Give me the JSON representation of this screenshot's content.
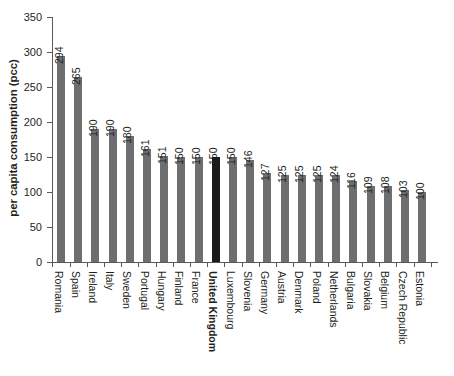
{
  "chart_data": {
    "type": "bar",
    "title": "",
    "subtitle": "",
    "xlabel": "",
    "ylabel": "per capita consumption (pcc)",
    "ylim": [
      0,
      350
    ],
    "yticks": [
      0,
      50,
      100,
      150,
      200,
      250,
      300,
      350
    ],
    "grid": false,
    "legend": null,
    "categories": [
      "Romania",
      "Spain",
      "Ireland",
      "Italy",
      "Sweden",
      "Portugal",
      "Hungary",
      "Finland",
      "France",
      "United Kingdom",
      "Luxembourg",
      "Slovenia",
      "Germany",
      "Austria",
      "Denmark",
      "Poland",
      "Netherlands",
      "Bulgaria",
      "Slovakia",
      "Belgium",
      "Czech Republic",
      "Estonia"
    ],
    "values": [
      294,
      265,
      190,
      190,
      180,
      161,
      151,
      150,
      150,
      150,
      150,
      146,
      127,
      125,
      125,
      125,
      124,
      116,
      109,
      108,
      103,
      100
    ],
    "highlight_category": "United Kingdom",
    "colors": {
      "bar": "#6d6e70",
      "highlight_bar": "#1a1a1a",
      "axis": "#58595b",
      "text": "#231f20",
      "background": "#ffffff"
    }
  }
}
